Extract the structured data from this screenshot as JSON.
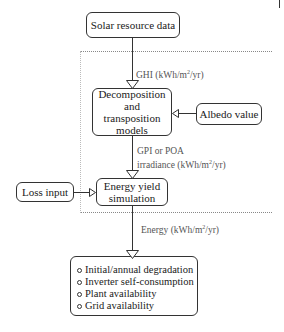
{
  "diagram": {
    "nodes": {
      "solar_resource": "Solar resource data",
      "decomposition_line1": "Decomposition",
      "decomposition_line2": "and",
      "decomposition_line3": "transposition",
      "decomposition_line4": "models",
      "albedo": "Albedo value",
      "loss_input": "Loss input",
      "energy_yield_line1": "Energy yield",
      "energy_yield_line2": "simulation"
    },
    "edges": {
      "ghi_label_prefix": "GHI (kWh/m",
      "ghi_label_sup": "2",
      "ghi_label_suffix": "/yr)",
      "gpi_label_line1": "GPI or POA",
      "gpi_label_line2_prefix": "irradiance (kWh/m",
      "gpi_label_line2_sup": "2",
      "gpi_label_line2_suffix": "/yr)",
      "energy_label_prefix": "Energy (kWh/m",
      "energy_label_sup": "2",
      "energy_label_suffix": "/yr)"
    },
    "output_list": [
      "Initial/annual degradation",
      "Inverter self-consumption",
      "Plant availability",
      "Grid availability"
    ]
  }
}
